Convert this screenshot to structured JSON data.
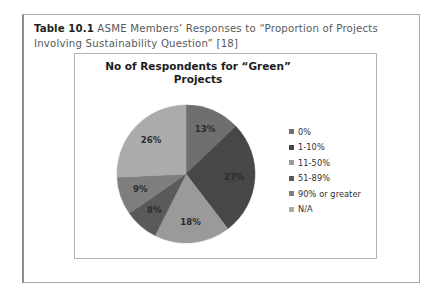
{
  "caption": {
    "label": "Table 10.1",
    "text": "ASME Members’ Responses to “Proportion of Projects Involving Sustainability Question” [18]"
  },
  "chart_data": {
    "type": "pie",
    "title": "No of Respondents for “Green” Projects",
    "title_line1": "No of Respondents for “Green”",
    "title_line2": "Projects",
    "xlabel": "",
    "ylabel": "",
    "grid": false,
    "legend_position": "right",
    "start_angle_deg": 0,
    "direction": "clockwise",
    "categories": [
      "0%",
      "1-10%",
      "11-50%",
      "51-89%",
      "90% or greater",
      "N/A"
    ],
    "values": [
      13,
      27,
      18,
      8,
      9,
      26
    ],
    "data_labels": [
      "13%",
      "27%",
      "18%",
      "8%",
      "9%",
      "26%"
    ],
    "colors": [
      "#6f6f6f",
      "#474747",
      "#9a9a9a",
      "#5a5a5a",
      "#7e7e7e",
      "#ababab"
    ],
    "label_colors": [
      "#2b2b2b",
      "#2b2b2b",
      "#2b2b2b",
      "#2b2b2b",
      "#2b2b2b",
      "#2b2b2b"
    ]
  },
  "legend": {
    "items": [
      {
        "label": "0%",
        "color": "#6f6f6f"
      },
      {
        "label": "1-10%",
        "color": "#474747"
      },
      {
        "label": "11-50%",
        "color": "#9a9a9a"
      },
      {
        "label": "51-89%",
        "color": "#5a5a5a"
      },
      {
        "label": "90% or greater",
        "color": "#7e7e7e"
      },
      {
        "label": "N/A",
        "color": "#ababab"
      }
    ]
  }
}
